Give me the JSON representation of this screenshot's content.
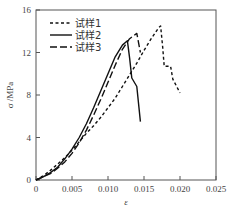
{
  "chart_data": {
    "type": "line",
    "title": "",
    "xlabel": "ε",
    "ylabel": "σ /MPa",
    "xlim": [
      0,
      0.025
    ],
    "ylim": [
      0,
      16
    ],
    "xticks": [
      "0",
      "0.005",
      "0.010",
      "0.015",
      "0.020",
      "0.025"
    ],
    "yticks": [
      "0",
      "4",
      "8",
      "12",
      "16"
    ],
    "grid": false,
    "legend_position": "upper left",
    "series": [
      {
        "name": "试样1",
        "style": "short-dash",
        "x": [
          0,
          0.001,
          0.002,
          0.003,
          0.004,
          0.005,
          0.006,
          0.007,
          0.008,
          0.009,
          0.01,
          0.011,
          0.012,
          0.013,
          0.014,
          0.015,
          0.016,
          0.017,
          0.0173,
          0.0176,
          0.0178,
          0.0187,
          0.019,
          0.02
        ],
        "y": [
          0,
          0.4,
          0.9,
          1.5,
          2.1,
          2.8,
          3.6,
          4.4,
          5.1,
          5.9,
          6.8,
          7.7,
          8.8,
          9.9,
          11.0,
          12.2,
          13.3,
          14.3,
          14.5,
          12.5,
          10.7,
          10.7,
          9.5,
          8.2
        ]
      },
      {
        "name": "试样2",
        "style": "solid",
        "x": [
          0,
          0.001,
          0.002,
          0.003,
          0.004,
          0.005,
          0.006,
          0.007,
          0.008,
          0.009,
          0.01,
          0.011,
          0.012,
          0.0127,
          0.013,
          0.0133,
          0.014,
          0.0145
        ],
        "y": [
          0,
          0.3,
          0.7,
          1.2,
          2.0,
          2.9,
          4.0,
          5.3,
          6.8,
          8.4,
          10.0,
          11.6,
          12.7,
          13.1,
          11.5,
          9.6,
          8.8,
          5.5
        ]
      },
      {
        "name": "试样3",
        "style": "long-dash",
        "x": [
          0,
          0.001,
          0.002,
          0.003,
          0.004,
          0.005,
          0.006,
          0.007,
          0.008,
          0.009,
          0.01,
          0.011,
          0.012,
          0.013,
          0.014,
          0.0145
        ],
        "y": [
          0,
          0.3,
          0.6,
          1.1,
          1.7,
          2.5,
          3.5,
          4.7,
          6.1,
          7.6,
          9.2,
          10.8,
          12.3,
          13.3,
          13.8,
          12.0
        ]
      }
    ]
  }
}
